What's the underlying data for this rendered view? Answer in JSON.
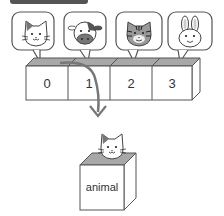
{
  "diagram": {
    "array": {
      "cells": [
        {
          "index": "0",
          "animal": "cat"
        },
        {
          "index": "1",
          "animal": "cow"
        },
        {
          "index": "2",
          "animal": "tiger"
        },
        {
          "index": "3",
          "animal": "rabbit"
        }
      ]
    },
    "variable": {
      "label": "animal",
      "animal": "cat"
    },
    "colors": {
      "stroke": "#555555",
      "box_top": "#a8a8a8",
      "arrow": "#777777",
      "header": "#555555"
    }
  }
}
